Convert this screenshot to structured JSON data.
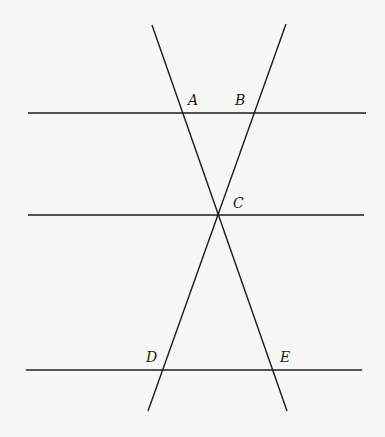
{
  "diagram": {
    "points": [
      {
        "id": "A",
        "label": "A"
      },
      {
        "id": "B",
        "label": "B"
      },
      {
        "id": "C",
        "label": "C"
      },
      {
        "id": "D",
        "label": "D"
      },
      {
        "id": "E",
        "label": "E"
      }
    ],
    "parallel_lines": [
      "top line through A and B",
      "middle line through C",
      "bottom line through D and E"
    ],
    "transversals": [
      "line through A, C, E",
      "line through B, C, D"
    ]
  }
}
